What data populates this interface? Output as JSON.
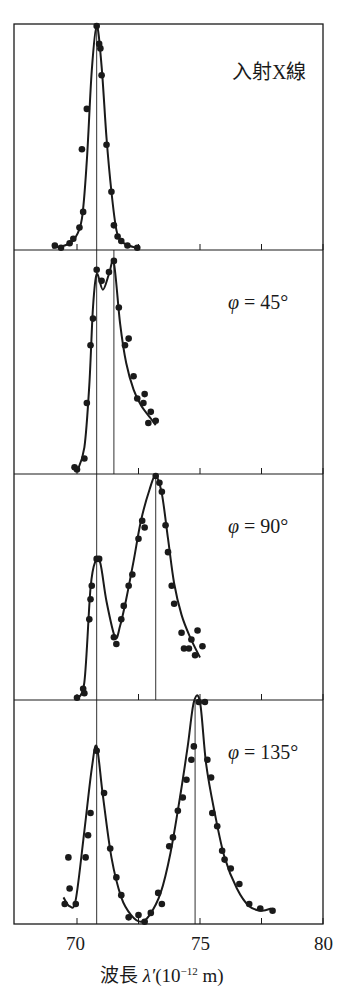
{
  "chart_data": {
    "type": "scatter",
    "title": "",
    "xlabel": "波長 λ′(10⁻¹² m)",
    "xlabel_parts": {
      "prefix": "波長 ",
      "symbol": "λ′",
      "unit_open": "(10",
      "exponent": "−12",
      "unit_close": " m)"
    },
    "ylabel": "",
    "xlim": [
      67.5,
      80
    ],
    "x_ticks": [
      70,
      72.5,
      75,
      77.5,
      80
    ],
    "x_tick_labels": [
      "70",
      "75",
      "80"
    ],
    "x_tick_label_values": [
      70,
      75,
      80
    ],
    "y_units": "relative intensity (0–100, peak normalized)",
    "panels": [
      {
        "label": "入射X線",
        "angle": null,
        "reference_lines": [
          70.8
        ],
        "fit_curve": [
          [
            69.0,
            1
          ],
          [
            69.5,
            2
          ],
          [
            69.9,
            5
          ],
          [
            70.2,
            14
          ],
          [
            70.4,
            40
          ],
          [
            70.6,
            80
          ],
          [
            70.8,
            100
          ],
          [
            71.0,
            82
          ],
          [
            71.2,
            50
          ],
          [
            71.4,
            26
          ],
          [
            71.6,
            9
          ],
          [
            71.8,
            4
          ],
          [
            72.1,
            2
          ],
          [
            72.4,
            1
          ]
        ],
        "points": [
          [
            69.1,
            2
          ],
          [
            69.35,
            1
          ],
          [
            69.7,
            3
          ],
          [
            69.85,
            5
          ],
          [
            70.1,
            10
          ],
          [
            70.25,
            17
          ],
          [
            70.2,
            45
          ],
          [
            70.4,
            63
          ],
          [
            70.8,
            100
          ],
          [
            70.9,
            92
          ],
          [
            70.95,
            90
          ],
          [
            71.0,
            78
          ],
          [
            71.2,
            47
          ],
          [
            71.4,
            26
          ],
          [
            71.5,
            11
          ],
          [
            71.65,
            6
          ],
          [
            71.8,
            4
          ],
          [
            72.05,
            2
          ],
          [
            72.45,
            1
          ]
        ]
      },
      {
        "label": "φ = 45°",
        "label_parts": {
          "symbol": "φ",
          "value": " = 45°"
        },
        "angle": 45,
        "reference_lines": [
          70.8,
          71.5
        ],
        "fit_curve": [
          [
            70.0,
            1
          ],
          [
            70.3,
            12
          ],
          [
            70.5,
            40
          ],
          [
            70.65,
            75
          ],
          [
            70.8,
            90
          ],
          [
            71.05,
            83
          ],
          [
            71.3,
            90
          ],
          [
            71.5,
            95
          ],
          [
            71.75,
            68
          ],
          [
            72.0,
            50
          ],
          [
            72.3,
            38
          ],
          [
            72.6,
            31
          ],
          [
            73.0,
            25
          ],
          [
            73.2,
            22
          ]
        ],
        "points": [
          [
            69.9,
            3
          ],
          [
            70.0,
            2
          ],
          [
            70.3,
            7
          ],
          [
            70.4,
            32
          ],
          [
            70.55,
            58
          ],
          [
            70.65,
            70
          ],
          [
            70.8,
            92
          ],
          [
            71.0,
            87
          ],
          [
            71.3,
            91
          ],
          [
            71.5,
            96
          ],
          [
            71.7,
            75
          ],
          [
            71.95,
            58
          ],
          [
            72.1,
            61
          ],
          [
            72.3,
            44
          ],
          [
            72.45,
            34
          ],
          [
            72.7,
            32
          ],
          [
            72.75,
            36
          ],
          [
            72.9,
            23
          ],
          [
            73.0,
            28
          ],
          [
            73.2,
            24
          ]
        ]
      },
      {
        "label": "φ = 90°",
        "label_parts": {
          "symbol": "φ",
          "value": " = 90°"
        },
        "angle": 90,
        "reference_lines": [
          70.8,
          73.2
        ],
        "fit_curve": [
          [
            70.0,
            1
          ],
          [
            70.3,
            8
          ],
          [
            70.55,
            50
          ],
          [
            70.75,
            62
          ],
          [
            70.95,
            61
          ],
          [
            71.2,
            44
          ],
          [
            71.55,
            28
          ],
          [
            71.75,
            33
          ],
          [
            72.0,
            45
          ],
          [
            72.3,
            62
          ],
          [
            72.6,
            80
          ],
          [
            72.95,
            94
          ],
          [
            73.2,
            100
          ],
          [
            73.45,
            92
          ],
          [
            73.7,
            72
          ],
          [
            73.95,
            52
          ],
          [
            74.25,
            38
          ],
          [
            74.6,
            28
          ],
          [
            75.0,
            19
          ]
        ],
        "points": [
          [
            70.0,
            1
          ],
          [
            70.25,
            5
          ],
          [
            70.3,
            3
          ],
          [
            70.5,
            36
          ],
          [
            70.55,
            45
          ],
          [
            70.6,
            51
          ],
          [
            70.8,
            63
          ],
          [
            70.9,
            63
          ],
          [
            71.5,
            28
          ],
          [
            71.6,
            25
          ],
          [
            71.8,
            36
          ],
          [
            71.9,
            42
          ],
          [
            72.1,
            51
          ],
          [
            72.25,
            56
          ],
          [
            72.5,
            72
          ],
          [
            72.65,
            80
          ],
          [
            72.75,
            77
          ],
          [
            73.2,
            100
          ],
          [
            73.35,
            97
          ],
          [
            73.45,
            93
          ],
          [
            73.6,
            78
          ],
          [
            73.7,
            66
          ],
          [
            73.85,
            51
          ],
          [
            73.95,
            43
          ],
          [
            74.25,
            30
          ],
          [
            74.35,
            23
          ],
          [
            74.55,
            23
          ],
          [
            74.65,
            27
          ],
          [
            74.8,
            20
          ],
          [
            74.9,
            31
          ],
          [
            75.1,
            24
          ]
        ]
      },
      {
        "label": "φ = 135°",
        "label_parts": {
          "symbol": "φ",
          "value": " = 135°"
        },
        "angle": 135,
        "reference_lines": [
          70.8,
          74.8
        ],
        "fit_curve": [
          [
            69.45,
            12
          ],
          [
            69.7,
            8
          ],
          [
            69.95,
            11
          ],
          [
            70.3,
            42
          ],
          [
            70.6,
            70
          ],
          [
            70.8,
            80
          ],
          [
            71.05,
            58
          ],
          [
            71.4,
            30
          ],
          [
            71.8,
            12
          ],
          [
            72.2,
            4
          ],
          [
            72.6,
            1
          ],
          [
            72.95,
            4
          ],
          [
            73.4,
            14
          ],
          [
            73.8,
            32
          ],
          [
            74.2,
            58
          ],
          [
            74.5,
            80
          ],
          [
            74.75,
            100
          ],
          [
            75.0,
            100
          ],
          [
            75.25,
            72
          ],
          [
            75.6,
            50
          ],
          [
            76.0,
            30
          ],
          [
            76.5,
            16
          ],
          [
            77.0,
            8
          ],
          [
            77.5,
            6
          ],
          [
            77.9,
            7
          ]
        ],
        "points": [
          [
            69.5,
            9
          ],
          [
            69.7,
            16
          ],
          [
            69.65,
            30
          ],
          [
            69.95,
            9
          ],
          [
            70.35,
            30
          ],
          [
            70.45,
            40
          ],
          [
            70.55,
            50
          ],
          [
            70.8,
            78
          ],
          [
            71.1,
            59
          ],
          [
            71.35,
            34
          ],
          [
            71.6,
            21
          ],
          [
            71.8,
            13
          ],
          [
            72.1,
            3
          ],
          [
            72.5,
            4
          ],
          [
            72.75,
            1
          ],
          [
            73.0,
            5
          ],
          [
            73.3,
            14
          ],
          [
            73.45,
            9
          ],
          [
            73.75,
            35
          ],
          [
            73.9,
            39
          ],
          [
            74.1,
            51
          ],
          [
            74.3,
            57
          ],
          [
            74.45,
            65
          ],
          [
            74.65,
            74
          ],
          [
            74.75,
            80
          ],
          [
            74.95,
            100
          ],
          [
            75.2,
            100
          ],
          [
            75.3,
            74
          ],
          [
            75.45,
            66
          ],
          [
            75.5,
            50
          ],
          [
            75.7,
            44
          ],
          [
            75.9,
            33
          ],
          [
            76.0,
            29
          ],
          [
            76.25,
            25
          ],
          [
            76.6,
            18
          ],
          [
            77.0,
            9
          ],
          [
            77.45,
            7
          ],
          [
            77.95,
            6
          ]
        ]
      }
    ],
    "grid": false,
    "legend": null
  },
  "labels": {
    "panel_0": "入射X線",
    "panel_1_symbol": "φ",
    "panel_1_value": " = 45°",
    "panel_2_symbol": "φ",
    "panel_2_value": " = 90°",
    "panel_3_symbol": "φ",
    "panel_3_value": " = 135°",
    "tick_70": "70",
    "tick_75": "75",
    "tick_80": "80",
    "xlabel_prefix": "波長 ",
    "xlabel_symbol": "λ′",
    "xlabel_open": "(10",
    "xlabel_exp": "−12",
    "xlabel_close": " m)"
  },
  "style": {
    "ink": "#1a1a1a",
    "background": "#ffffff"
  }
}
